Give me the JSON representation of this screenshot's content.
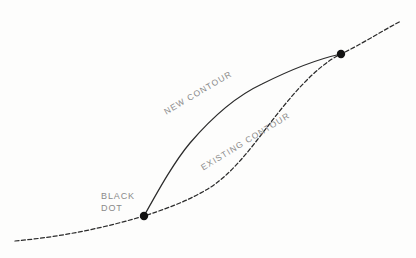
{
  "diagram": {
    "background_color": "#fdfdfc",
    "line_color": "#2b2b2b",
    "dot_color": "#121212",
    "label_color": "#8a8a8a",
    "labels": {
      "new_contour": "NEW CONTOUR",
      "existing_contour": "EXISTING CONTOUR",
      "black_dot_line1": "BLACK",
      "black_dot_line2": "DOT"
    },
    "annotations": {
      "new_contour_rotation_deg": -30.5,
      "existing_contour_rotation_deg": -31.5
    },
    "dots": [
      {
        "name": "lower-black-dot",
        "x": 144,
        "y": 216,
        "r": 4.2
      },
      {
        "name": "upper-black-dot",
        "x": 341,
        "y": 54,
        "r": 4.2
      }
    ],
    "curves": [
      {
        "name": "existing-contour-curve",
        "style": "dashed",
        "dash_pattern": "4 2.4",
        "width": 1.25,
        "path": "M 15 241 C 60 237 104 228 144 216 C 178 205 192 198 206 190 C 230 176 248 152 268 126 C 290 97 316 66 341 54 C 360 45 382 31 401 21"
      },
      {
        "name": "new-contour-curve",
        "style": "solid",
        "width": 1.25,
        "path": "M 144 216 C 158 191 174 162 190 143 C 208 122 232 98 262 84 C 288 71 318 59 341 54"
      }
    ]
  }
}
